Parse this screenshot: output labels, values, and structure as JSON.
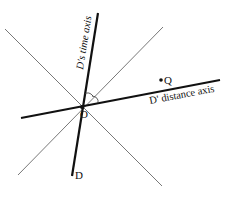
{
  "diagram": {
    "type": "spacetime-diagram",
    "origin_label": "O",
    "event_label": "Q",
    "time_axis_label": "D's time axis",
    "distance_axis_label": "D' distance axis",
    "time_axis_end_label": "D",
    "colors": {
      "axis": "#111111",
      "light_line": "#555555",
      "background": "#ffffff"
    }
  }
}
